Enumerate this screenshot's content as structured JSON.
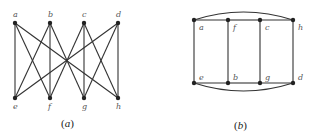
{
  "figure": {
    "panels": [
      {
        "id": "a",
        "caption_letter": "a",
        "nodes": [
          {
            "id": "a",
            "label": "a",
            "x": 15,
            "y": 23
          },
          {
            "id": "b",
            "label": "b",
            "x": 50,
            "y": 23
          },
          {
            "id": "c",
            "label": "c",
            "x": 84,
            "y": 23
          },
          {
            "id": "d",
            "label": "d",
            "x": 118,
            "y": 23
          },
          {
            "id": "e",
            "label": "e",
            "x": 15,
            "y": 98
          },
          {
            "id": "f",
            "label": "f",
            "x": 50,
            "y": 98
          },
          {
            "id": "g",
            "label": "g",
            "x": 84,
            "y": 98
          },
          {
            "id": "h",
            "label": "h",
            "x": 118,
            "y": 98
          }
        ],
        "edges": [
          [
            "a",
            "e"
          ],
          [
            "a",
            "f"
          ],
          [
            "a",
            "h"
          ],
          [
            "b",
            "e"
          ],
          [
            "b",
            "f"
          ],
          [
            "b",
            "g"
          ],
          [
            "c",
            "f"
          ],
          [
            "c",
            "g"
          ],
          [
            "c",
            "h"
          ],
          [
            "d",
            "e"
          ],
          [
            "d",
            "g"
          ],
          [
            "d",
            "h"
          ]
        ]
      },
      {
        "id": "b",
        "caption_letter": "b",
        "nodes": [
          {
            "id": "a",
            "label": "a",
            "x": 194,
            "y": 20
          },
          {
            "id": "f",
            "label": "f",
            "x": 228,
            "y": 20
          },
          {
            "id": "c",
            "label": "c",
            "x": 260,
            "y": 20
          },
          {
            "id": "h",
            "label": "h",
            "x": 293,
            "y": 20
          },
          {
            "id": "e",
            "label": "e",
            "x": 194,
            "y": 83
          },
          {
            "id": "b",
            "label": "b",
            "x": 228,
            "y": 83
          },
          {
            "id": "g",
            "label": "g",
            "x": 260,
            "y": 83
          },
          {
            "id": "d",
            "label": "d",
            "x": 293,
            "y": 83
          }
        ],
        "edges": [
          [
            "a",
            "f"
          ],
          [
            "f",
            "c"
          ],
          [
            "c",
            "h"
          ],
          [
            "e",
            "b"
          ],
          [
            "b",
            "g"
          ],
          [
            "g",
            "d"
          ],
          [
            "a",
            "e"
          ],
          [
            "f",
            "b"
          ],
          [
            "c",
            "g"
          ],
          [
            "h",
            "d"
          ]
        ],
        "arcs": [
          [
            "a",
            "h",
            "top"
          ],
          [
            "e",
            "d",
            "bottom"
          ]
        ]
      }
    ]
  }
}
